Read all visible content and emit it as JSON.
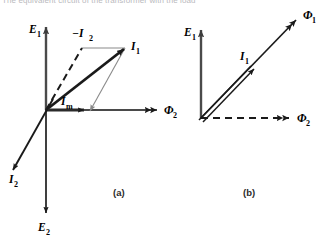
{
  "figure": {
    "cropped_header_text": "The equivalent circuit of the transformer with the load",
    "captions": [
      {
        "id": "caption-a",
        "text": "(a)"
      },
      {
        "id": "caption-b",
        "text": "(b)"
      }
    ]
  },
  "diagram_a": {
    "name": "phasor-diagram-a",
    "axes": [
      {
        "name": "axis-E1",
        "label": "E",
        "sub": "1",
        "direction": "up"
      },
      {
        "name": "axis-E2",
        "label": "E",
        "sub": "2",
        "direction": "down"
      },
      {
        "name": "axis-Phi2",
        "label": "Φ",
        "sub": "2",
        "direction": "right",
        "arrowhead": "double"
      }
    ],
    "vectors": [
      {
        "name": "vector-I1",
        "label": "I",
        "sub": "1",
        "style": "thick-solid"
      },
      {
        "name": "vector-I2",
        "label": "I",
        "sub": "2",
        "style": "solid"
      },
      {
        "name": "vector-minus-I2",
        "label": "−I",
        "sub": "2",
        "style": "dashed"
      },
      {
        "name": "vector-Im",
        "label": "I",
        "sub": "m",
        "style": "thick-short"
      }
    ],
    "construction_lines": [
      {
        "name": "parallelogram-top-edge"
      },
      {
        "name": "parallelogram-right-edge"
      }
    ]
  },
  "diagram_b": {
    "name": "phasor-diagram-b",
    "axes": [
      {
        "name": "axis-E1",
        "label": "E",
        "sub": "1",
        "direction": "up"
      },
      {
        "name": "axis-Phi2",
        "label": "Φ",
        "sub": "2",
        "direction": "right",
        "arrowhead": "double",
        "style": "dashed"
      },
      {
        "name": "axis-Phi1",
        "label": "Φ",
        "sub": "1",
        "direction": "diagonal-up-right",
        "arrowhead": "double"
      }
    ],
    "vectors": [
      {
        "name": "vector-I1",
        "label": "I",
        "sub": "1",
        "style": "double-line"
      }
    ]
  },
  "colors": {
    "stroke": "#1a1a1a",
    "light_stroke": "#8a8a8a",
    "axis": "#4a4a4a",
    "background": "#ffffff"
  }
}
